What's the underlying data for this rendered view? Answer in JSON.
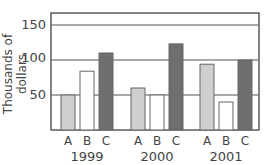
{
  "chart_data": {
    "type": "bar",
    "title": "",
    "xlabel": "",
    "ylabel": "Thousands of dollars",
    "ylim": [
      0,
      160
    ],
    "yticks": [
      50,
      100,
      150
    ],
    "grid": true,
    "groups": [
      "1999",
      "2000",
      "2001"
    ],
    "categories": [
      "A",
      "B",
      "C"
    ],
    "series": [
      {
        "name": "A",
        "color": "#cfcfcf",
        "values": [
          50,
          60,
          94
        ]
      },
      {
        "name": "B",
        "color": "#ffffff",
        "values": [
          84,
          50,
          40
        ]
      },
      {
        "name": "C",
        "color": "#6e6e6e",
        "values": [
          110,
          123,
          100
        ]
      }
    ]
  },
  "labels": {
    "ylabel": "Thousands of dollars",
    "ticks": [
      "150",
      "100",
      "50"
    ],
    "years": [
      "1999",
      "2000",
      "2001"
    ],
    "cats": [
      "A",
      "B",
      "C"
    ]
  }
}
